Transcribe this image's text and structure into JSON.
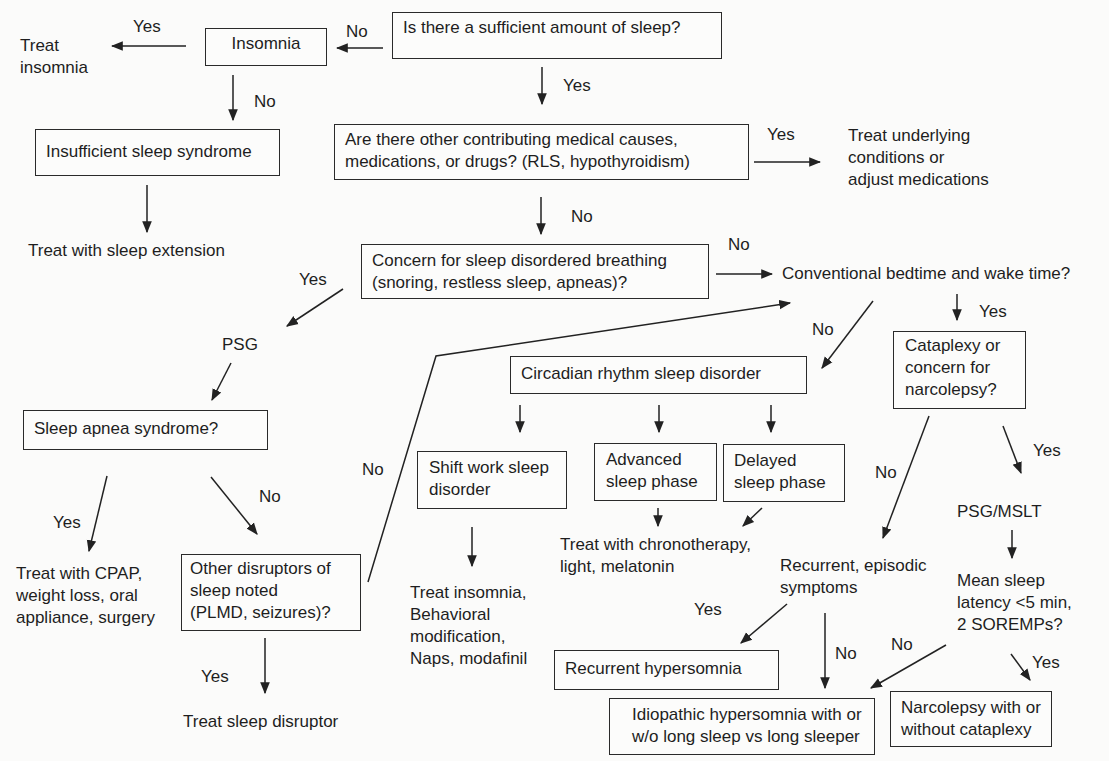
{
  "diagram": {
    "type": "flowchart",
    "topic": "Evaluation of sleepiness",
    "nodes": {
      "q_sufficient": "Is there a sufficient amount of sleep?",
      "insomnia": "Insomnia",
      "treat_insomnia": "Treat\ninsomnia",
      "insufficient_syndrome": "Insufficient sleep syndrome",
      "treat_extension": "Treat with sleep extension",
      "q_medical": "Are there other contributing medical causes,\nmedications, or drugs? (RLS, hypothyroidism)",
      "treat_underlying": "Treat underlying\nconditions or\nadjust medications",
      "q_breathing": "Concern for sleep disordered breathing\n(snoring, restless sleep, apneas)?",
      "q_conventional": "Conventional bedtime and wake time?",
      "psg": "PSG",
      "q_apnea": "Sleep apnea syndrome?",
      "treat_cpap": "Treat with CPAP,\nweight loss, oral\nappliance, surgery",
      "q_other_disruptors": "Other disruptors of\nsleep noted\n(PLMD, seizures)?",
      "treat_disruptor": "Treat sleep disruptor",
      "circadian": "Circadian rhythm sleep disorder",
      "shift_work": "Shift work sleep\ndisorder",
      "advanced_phase": "Advanced\nsleep phase",
      "delayed_phase": "Delayed\nsleep phase",
      "treat_chrono": "Treat with chronotherapy,\nlight, melatonin",
      "treat_shift": "Treat insomnia,\nBehavioral\nmodification,\nNaps, modafinil",
      "q_cataplexy": "Cataplexy or\nconcern for\nnarcolepsy?",
      "recurrent_symptoms": "Recurrent, episodic\nsymptoms",
      "psg_mslt": "PSG/MSLT",
      "q_latency": "Mean sleep\nlatency <5 min,\n2 SOREMPs?",
      "recurrent_hypersomnia": "Recurrent hypersomnia",
      "idiopathic": "Idiopathic hypersomnia with or\nw/o long sleep vs long sleeper",
      "narcolepsy": "Narcolepsy with or\nwithout cataplexy"
    },
    "edge_labels": {
      "sufficient_no": "No",
      "insomnia_yes": "Yes",
      "insomnia_no": "No",
      "sufficient_yes": "Yes",
      "medical_yes": "Yes",
      "medical_no": "No",
      "breathing_no": "No",
      "breathing_yes": "Yes",
      "conventional_yes": "Yes",
      "conventional_no": "No",
      "apnea_yes": "Yes",
      "apnea_no": "No",
      "disruptors_no": "No",
      "disruptors_yes": "Yes",
      "cataplexy_no": "No",
      "cataplexy_yes": "Yes",
      "recurrent_yes": "Yes",
      "recurrent_no": "No",
      "latency_no": "No",
      "latency_yes": "Yes"
    }
  }
}
